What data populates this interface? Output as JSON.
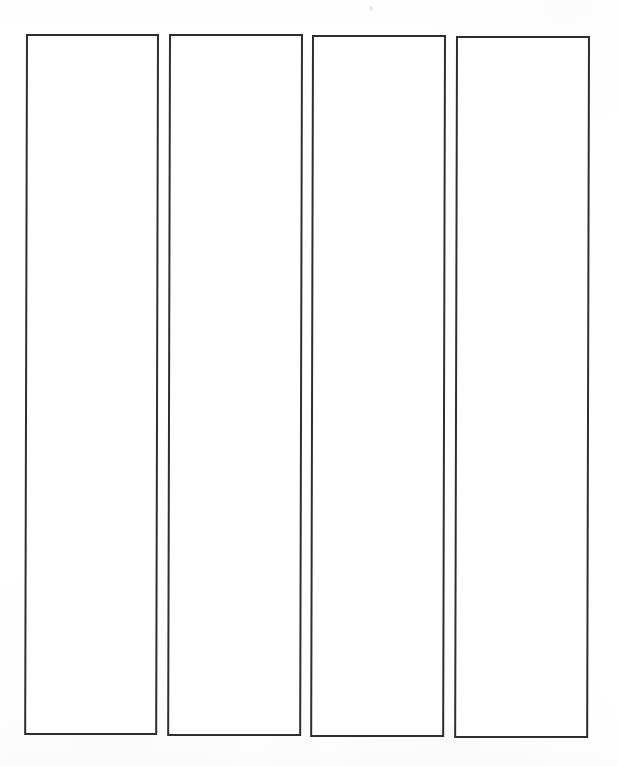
{
  "document": {
    "kind": "scanned-blank-form",
    "page_background_color": "#ffffff",
    "line_color": "#2e2e2e",
    "page_width": 618,
    "page_height": 766,
    "title": "",
    "visible_text": "",
    "notes": "Blank scanned sheet containing four tall empty outlined rectangular columns. No text, labels, numbers or other content appear anywhere on the page."
  },
  "columns": [
    {
      "id": "column-1",
      "label": "",
      "content": "",
      "x": 26,
      "y": 34,
      "width": 133,
      "height": 701,
      "border_width": 2,
      "border_color": "#2e2e2e",
      "fill_color": "#ffffff",
      "skew_deg": 0.15
    },
    {
      "id": "column-2",
      "label": "",
      "content": "",
      "x": 169,
      "y": 34,
      "width": 134,
      "height": 702,
      "border_width": 2,
      "border_color": "#2e2e2e",
      "fill_color": "#ffffff",
      "skew_deg": 0.15
    },
    {
      "id": "column-3",
      "label": "",
      "content": "",
      "x": 312,
      "y": 35,
      "width": 134,
      "height": 702,
      "border_width": 2,
      "border_color": "#2e2e2e",
      "fill_color": "#ffffff",
      "skew_deg": 0.15
    },
    {
      "id": "column-4",
      "label": "",
      "content": "",
      "x": 456,
      "y": 36,
      "width": 134,
      "height": 702,
      "border_width": 2,
      "border_color": "#2e2e2e",
      "fill_color": "#ffffff",
      "skew_deg": 0.15
    }
  ],
  "artifacts": [
    {
      "id": "scan-speck",
      "description": "faint scanner speck",
      "x": 369,
      "y": 6
    }
  ]
}
